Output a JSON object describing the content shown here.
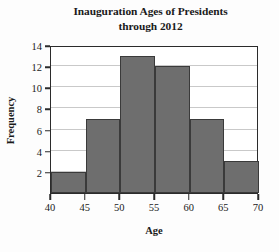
{
  "chart_data": {
    "type": "bar",
    "title": "Inauguration Ages of Presidents through 2012",
    "title_lines": [
      "Inauguration Ages of Presidents",
      "through 2012"
    ],
    "xlabel": "Age",
    "ylabel": "Frequency",
    "categories": [
      "40-45",
      "45-50",
      "50-55",
      "55-60",
      "60-65",
      "65-70"
    ],
    "bin_edges": [
      40,
      45,
      50,
      55,
      60,
      65,
      70
    ],
    "values": [
      2,
      7,
      13,
      12,
      7,
      3
    ],
    "xlim": [
      40,
      70
    ],
    "ylim": [
      0,
      14
    ],
    "xticks": [
      40,
      45,
      50,
      55,
      60,
      65,
      70
    ],
    "yticks": [
      2,
      4,
      6,
      8,
      10,
      12,
      14
    ],
    "xtick_labels": [
      "40",
      "45",
      "50",
      "55",
      "60",
      "65",
      "70"
    ],
    "ytick_labels": [
      "2",
      "4",
      "6",
      "8",
      "10",
      "12",
      "14"
    ],
    "grid": "horizontal",
    "legend": "none",
    "bar_color": "#6e6e6e",
    "bar_edge_color": "#3a3a3a",
    "grid_color": "#c9c9c9",
    "axis_color": "#2b2b2b",
    "background_color": "#ffffff"
  }
}
